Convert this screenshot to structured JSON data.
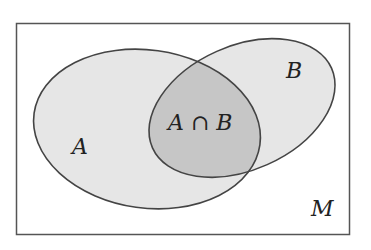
{
  "diagram": {
    "type": "venn",
    "universe": {
      "label": "M"
    },
    "sets": [
      {
        "label": "A"
      },
      {
        "label": "B"
      }
    ],
    "intersection": {
      "label": "A ∩ B"
    },
    "colors": {
      "background": "#ffffff",
      "set_fill": "#e6e6e6",
      "intersection_fill": "#c6c6c6",
      "stroke": "#444444"
    }
  }
}
